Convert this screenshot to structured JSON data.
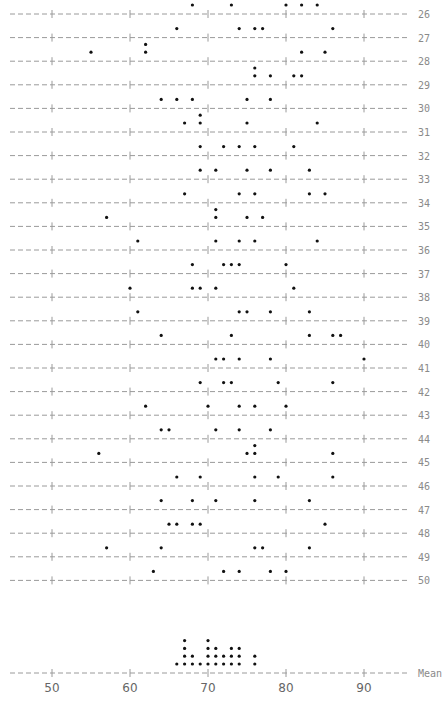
{
  "chart_data": {
    "type": "scatter",
    "subtype": "character dotplot (one row per sample, plus stacked dotplot of means)",
    "title": "",
    "xlabel": "",
    "ylabel": "",
    "xlim": [
      45,
      96
    ],
    "x_ticks": [
      50,
      60,
      70,
      80,
      90
    ],
    "grid": false,
    "legend": null,
    "rows": [
      {
        "label": "26",
        "values": [
          68,
          73,
          80,
          82,
          84
        ]
      },
      {
        "label": "27",
        "values": [
          66,
          74,
          76,
          77,
          86
        ]
      },
      {
        "label": "28",
        "values": [
          55,
          62,
          62,
          82,
          85
        ]
      },
      {
        "label": "29",
        "values": [
          76,
          76,
          78,
          81,
          82
        ]
      },
      {
        "label": "30",
        "values": [
          64,
          66,
          68,
          75,
          78
        ]
      },
      {
        "label": "31",
        "values": [
          67,
          69,
          69,
          75,
          84
        ]
      },
      {
        "label": "32",
        "values": [
          69,
          72,
          74,
          76,
          81
        ]
      },
      {
        "label": "33",
        "values": [
          69,
          71,
          75,
          78,
          83
        ]
      },
      {
        "label": "34",
        "values": [
          67,
          74,
          76,
          83,
          85
        ]
      },
      {
        "label": "35",
        "values": [
          57,
          71,
          71,
          75,
          77
        ]
      },
      {
        "label": "36",
        "values": [
          61,
          71,
          74,
          76,
          84
        ]
      },
      {
        "label": "37",
        "values": [
          68,
          72,
          73,
          74,
          80
        ]
      },
      {
        "label": "38",
        "values": [
          60,
          68,
          69,
          71,
          81
        ]
      },
      {
        "label": "39",
        "values": [
          61,
          74,
          75,
          78,
          83
        ]
      },
      {
        "label": "40",
        "values": [
          64,
          73,
          83,
          86,
          87
        ]
      },
      {
        "label": "41",
        "values": [
          71,
          72,
          74,
          78,
          90
        ]
      },
      {
        "label": "42",
        "values": [
          69,
          72,
          73,
          79,
          86
        ]
      },
      {
        "label": "43",
        "values": [
          62,
          70,
          74,
          76,
          80
        ]
      },
      {
        "label": "44",
        "values": [
          64,
          65,
          71,
          74,
          78
        ]
      },
      {
        "label": "45",
        "values": [
          56,
          75,
          76,
          76,
          86
        ]
      },
      {
        "label": "46",
        "values": [
          66,
          69,
          76,
          79,
          86
        ]
      },
      {
        "label": "47",
        "values": [
          64,
          68,
          71,
          76,
          83
        ]
      },
      {
        "label": "48",
        "values": [
          65,
          66,
          68,
          69,
          85
        ]
      },
      {
        "label": "49",
        "values": [
          57,
          64,
          76,
          77,
          83
        ]
      },
      {
        "label": "50",
        "values": [
          63,
          72,
          74,
          78,
          80
        ]
      }
    ],
    "mean_row": {
      "label": "Mean",
      "counts": [
        {
          "x": 66,
          "count": 1
        },
        {
          "x": 67,
          "count": 4
        },
        {
          "x": 68,
          "count": 2
        },
        {
          "x": 69,
          "count": 1
        },
        {
          "x": 70,
          "count": 4
        },
        {
          "x": 71,
          "count": 3
        },
        {
          "x": 72,
          "count": 2
        },
        {
          "x": 73,
          "count": 3
        },
        {
          "x": 74,
          "count": 3
        },
        {
          "x": 76,
          "count": 2
        }
      ]
    }
  },
  "colors": {
    "dot": "#111111",
    "line": "#9a9a9a",
    "label": "#8a8a8a"
  }
}
